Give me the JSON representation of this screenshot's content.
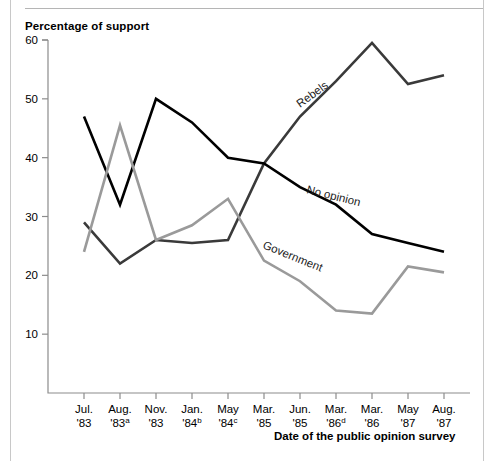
{
  "page": {
    "clipped_top_text": "",
    "y_axis_title": "Percentage of support",
    "x_axis_title": "Date of the public opinion survey"
  },
  "chart_data": {
    "type": "line",
    "title": "",
    "ylabel": "Percentage of support",
    "xlabel": "Date of the public opinion survey",
    "ylim": [
      0,
      60
    ],
    "yticks": [
      10,
      20,
      30,
      40,
      50,
      60
    ],
    "ytick_labels": [
      "10",
      "20",
      "30",
      "40",
      "50",
      "60"
    ],
    "grid": false,
    "legend": "inline-annotations",
    "categories": [
      "Jul. '83",
      "Aug. '83a",
      "Nov. '83",
      "Jan. '84b",
      "May '84c",
      "Mar. '85",
      "Jun. '85",
      "Mar. '86d",
      "Mar. '86",
      "May '87",
      "Aug. '87"
    ],
    "category_parts": [
      {
        "month": "Jul.",
        "year": "'83",
        "note": ""
      },
      {
        "month": "Aug.",
        "year": "'83",
        "note": "a"
      },
      {
        "month": "Nov.",
        "year": "'83",
        "note": ""
      },
      {
        "month": "Jan.",
        "year": "'84",
        "note": "b"
      },
      {
        "month": "May",
        "year": "'84",
        "note": "c"
      },
      {
        "month": "Mar.",
        "year": "'85",
        "note": ""
      },
      {
        "month": "Jun.",
        "year": "'85",
        "note": ""
      },
      {
        "month": "Mar.",
        "year": "'86",
        "note": "d"
      },
      {
        "month": "Mar.",
        "year": "'86",
        "note": ""
      },
      {
        "month": "May",
        "year": "'87",
        "note": ""
      },
      {
        "month": "Aug.",
        "year": "'87",
        "note": ""
      }
    ],
    "series": [
      {
        "name": "Rebels",
        "color": "#3a3a3a",
        "values": [
          29,
          22,
          26,
          25.5,
          26,
          39,
          47,
          53,
          59.5,
          52.5,
          54
        ]
      },
      {
        "name": "No opinion",
        "color": "#000000",
        "values": [
          47,
          32,
          50,
          46,
          40,
          39,
          35,
          32,
          27,
          25.5,
          24
        ]
      },
      {
        "name": "Government",
        "color": "#9a9a9a",
        "values": [
          24,
          45.5,
          26,
          28.5,
          33,
          22.5,
          19,
          14,
          13.5,
          21.5,
          20.5
        ]
      }
    ],
    "annotations": [
      {
        "text": "Rebels",
        "series": "Rebels"
      },
      {
        "text": "No opinion",
        "series": "No opinion"
      },
      {
        "text": "Government",
        "series": "Government"
      }
    ]
  }
}
